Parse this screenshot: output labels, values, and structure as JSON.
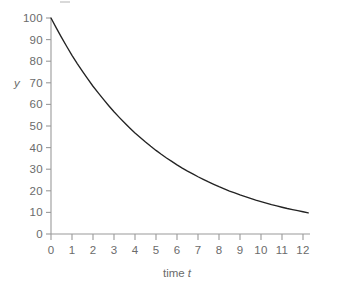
{
  "chart_data": {
    "type": "line",
    "title": "",
    "subtitle": "",
    "xlabel": "time t",
    "ylabel": "y",
    "xlim": [
      0,
      12.3
    ],
    "ylim": [
      0,
      103
    ],
    "grid": false,
    "legend": null,
    "x_ticks": [
      0,
      1,
      2,
      3,
      4,
      5,
      6,
      7,
      8,
      9,
      10,
      11,
      12
    ],
    "x_tick_labels": [
      "0",
      "1",
      "2",
      "3",
      "4",
      "5",
      "6",
      "7",
      "8",
      "9",
      "10",
      "11",
      "12"
    ],
    "y_ticks": [
      0,
      10,
      20,
      30,
      40,
      50,
      60,
      70,
      80,
      90,
      100
    ],
    "y_tick_labels": [
      "0",
      "10",
      "20",
      "30",
      "40",
      "50",
      "60",
      "70",
      "80",
      "90",
      "100"
    ],
    "series": [
      {
        "name": "y",
        "color": "#232323",
        "style": "solid",
        "x": [
          0,
          0.25,
          0.5,
          0.75,
          1,
          1.25,
          1.5,
          1.75,
          2,
          2.25,
          2.5,
          2.75,
          3,
          3.25,
          3.5,
          3.75,
          4,
          4.25,
          4.5,
          4.75,
          5,
          5.25,
          5.5,
          5.75,
          6,
          6.25,
          6.5,
          6.75,
          7,
          7.25,
          7.5,
          7.75,
          8,
          8.25,
          8.5,
          8.75,
          9,
          9.25,
          9.5,
          9.75,
          10,
          10.25,
          10.5,
          10.75,
          11,
          11.25,
          11.5,
          11.75,
          12,
          12.25
        ],
        "y": [
          100.0,
          95.4,
          91.0,
          86.8,
          82.7,
          78.9,
          75.3,
          71.8,
          68.4,
          65.3,
          62.3,
          59.4,
          56.6,
          54.0,
          51.5,
          49.1,
          46.8,
          44.7,
          42.6,
          40.6,
          38.7,
          36.9,
          35.2,
          33.6,
          32.0,
          30.5,
          29.1,
          27.8,
          26.5,
          25.3,
          24.1,
          23.0,
          21.9,
          20.9,
          19.9,
          19.0,
          18.1,
          17.3,
          16.5,
          15.7,
          15.0,
          14.3,
          13.6,
          13.0,
          12.4,
          11.8,
          11.3,
          10.8,
          10.3,
          9.8
        ]
      }
    ]
  }
}
